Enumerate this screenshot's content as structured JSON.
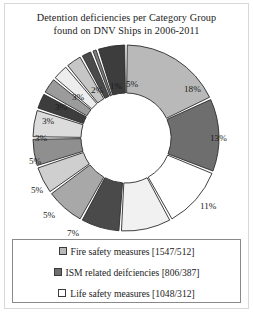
{
  "chart_data": {
    "type": "pie",
    "title": "Detention deficiencies per Category Group found on DNV Ships in 2006-2011",
    "title_line1": "Detention deficiencies per Category Group",
    "title_line2": "found on DNV Ships in 2006-2011",
    "xlabel": "",
    "ylabel": "",
    "donut": true,
    "grid": false,
    "legend_position": "bottom",
    "value_unit": "%",
    "categories": [
      "Fire safety measures",
      "ISM related deifciencies",
      "Life safety measures",
      "Slice 4",
      "Slice 5",
      "Slice 6",
      "Slice 7",
      "Slice 8",
      "Slice 9",
      "Slice 10",
      "Slice 11",
      "Slice 12",
      "Slice 13",
      "Slice 14",
      "Slice 15",
      "Slice 16"
    ],
    "values": [
      18,
      13,
      11,
      9,
      7,
      7,
      5,
      5,
      5,
      3,
      3,
      3,
      3,
      2,
      1,
      5
    ],
    "labels": [
      "18%",
      "13%",
      "11%",
      "9%",
      "7%",
      "7%",
      "5%",
      "5%",
      "5%",
      "3%",
      "3%",
      "3%",
      "3%",
      "2%",
      "1%",
      "5%"
    ],
    "slice_colors": [
      "#b9b9b9",
      "#6e6e6e",
      "#ffffff",
      "#f1f1f1",
      "#4a4a4a",
      "#a8a8a8",
      "#cfcfcf",
      "#8f8f8f",
      "#dcdcdc",
      "#3d3d3d",
      "#9b9b9b",
      "#ededed",
      "#c6c6c6",
      "#4a4a4a",
      "#7d7d7d",
      "#3d3d3d"
    ],
    "slice_label_positions": [
      {
        "text": "18%",
        "x": 170,
        "y": 46
      },
      {
        "text": "13%",
        "x": 196,
        "y": 95
      },
      {
        "text": "11%",
        "x": 186,
        "y": 163
      },
      {
        "text": "9%",
        "x": 132,
        "y": 207
      },
      {
        "text": "7%",
        "x": 88,
        "y": 208
      },
      {
        "text": "7%",
        "x": 53,
        "y": 190
      },
      {
        "text": "5%",
        "x": 29,
        "y": 172
      },
      {
        "text": "5%",
        "x": 17,
        "y": 147
      },
      {
        "text": "5%",
        "x": 15,
        "y": 118
      },
      {
        "text": "3%",
        "x": 21,
        "y": 95
      },
      {
        "text": "3%",
        "x": 28,
        "y": 78
      },
      {
        "text": "3%",
        "x": 41,
        "y": 64
      },
      {
        "text": "3%",
        "x": 58,
        "y": 54
      },
      {
        "text": "2%",
        "x": 77,
        "y": 47
      },
      {
        "text": "1%",
        "x": 96,
        "y": 43
      },
      {
        "text": "5%",
        "x": 112,
        "y": 41
      }
    ]
  },
  "legend": {
    "items": [
      {
        "label": "Fire safety measures [1547/512]",
        "color": "#b9b9b9",
        "swatch_name": "legend-swatch-fire-safety"
      },
      {
        "label": "ISM related deifciencies [806/387]",
        "color": "#6e6e6e",
        "swatch_name": "legend-swatch-ism-related"
      },
      {
        "label": "Life safety measures [1048/312]",
        "color": "#ffffff",
        "swatch_name": "legend-swatch-life-safety"
      }
    ]
  },
  "colors": {
    "text": "#1b1b1b",
    "frame": "#d8d8d8",
    "legend_border": "#8a8a8a",
    "slice_outline": "#2b2b2b",
    "background": "#ffffff"
  }
}
